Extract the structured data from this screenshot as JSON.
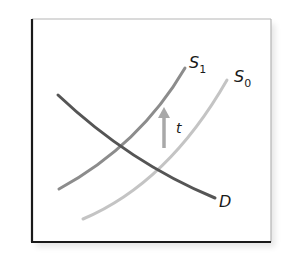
{
  "diagram": {
    "title": "",
    "type": "supply-demand-tax-shift",
    "axes": {
      "x_label": "",
      "y_label": ""
    },
    "curves": [
      {
        "id": "D",
        "label": "D",
        "color": "#555555",
        "kind": "demand"
      },
      {
        "id": "S1",
        "label": "S",
        "subscript": "1",
        "color": "#8c8c8c",
        "kind": "supply-after-tax"
      },
      {
        "id": "S0",
        "label": "S",
        "subscript": "0",
        "color": "#c4c4c4",
        "kind": "supply-before-tax"
      }
    ],
    "shift_arrow": {
      "label": "t",
      "direction": "up",
      "color": "#a8a8a8"
    },
    "colors": {
      "axis": "#1a1a1a",
      "frame_edge": "#b5b5b5",
      "background": "#ffffff"
    }
  }
}
